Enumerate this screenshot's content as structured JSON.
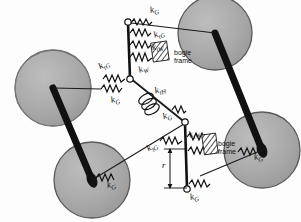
{
  "figure": {
    "type": "mechanical-schematic",
    "bg_color": "#fdfdfd",
    "wheel_fill": "#a8a8a8",
    "wheel_stroke": "#555555",
    "axle_color": "#111111",
    "line_color": "#1a1a1a"
  },
  "wheels": [
    {
      "id": "wheel-upper-left",
      "cx": 53,
      "cy": 88,
      "r": 38
    },
    {
      "id": "wheel-upper-right",
      "cx": 215,
      "cy": 33,
      "r": 37
    },
    {
      "id": "wheel-lower-left",
      "cx": 92,
      "cy": 180,
      "r": 38
    },
    {
      "id": "wheel-lower-right",
      "cx": 262,
      "cy": 150,
      "r": 38
    }
  ],
  "axles": [
    {
      "id": "axle-left",
      "x1": 53,
      "y1": 88,
      "x2": 92,
      "y2": 180
    },
    {
      "id": "axle-right",
      "x1": 215,
      "y1": 33,
      "x2": 262,
      "y2": 150
    }
  ],
  "bars": [
    {
      "id": "bar-upper",
      "x1": 128,
      "y1": 22,
      "x2": 130,
      "y2": 78
    },
    {
      "id": "bar-lower",
      "x1": 185,
      "y1": 122,
      "x2": 187,
      "y2": 189
    }
  ],
  "labels": [
    {
      "id": "label-kg-top",
      "base": "k",
      "sub": "G",
      "x": 150,
      "y": 10,
      "rot": -12
    },
    {
      "id": "label-ktg-top",
      "base": "k",
      "sub": "tG",
      "x": 154,
      "y": 33,
      "rot": -20
    },
    {
      "id": "label-ktw-top",
      "base": "k",
      "sub": "tW",
      "x": 152,
      "y": 47,
      "rot": -12
    },
    {
      "id": "label-kw-top",
      "base": "k",
      "sub": "W",
      "x": 140,
      "y": 70,
      "rot": -22
    },
    {
      "id": "label-ktg-left",
      "base": "k",
      "sub": "tG",
      "x": 101,
      "y": 65,
      "rot": -28
    },
    {
      "id": "label-kg-left",
      "base": "k",
      "sub": "G",
      "x": 113,
      "y": 99,
      "rot": -14
    },
    {
      "id": "label-kth-mid",
      "base": "k",
      "sub": "tH",
      "x": 155,
      "y": 90,
      "rot": -16
    },
    {
      "id": "label-kg-mid",
      "base": "k",
      "sub": "G",
      "x": 163,
      "y": 116,
      "rot": -18
    },
    {
      "id": "label-ktw-bottom",
      "base": "k",
      "sub": "tW",
      "x": 189,
      "y": 135,
      "rot": -18
    },
    {
      "id": "label-ktg-bottom",
      "base": "k",
      "sub": "tG",
      "x": 148,
      "y": 147,
      "rot": -30
    },
    {
      "id": "label-kg-bottom",
      "base": "k",
      "sub": "G",
      "x": 190,
      "y": 196,
      "rot": -12
    },
    {
      "id": "label-kg-wheel-bl",
      "base": "k",
      "sub": "G",
      "x": 108,
      "y": 183,
      "rot": -12
    },
    {
      "id": "label-kg-wheel-br",
      "base": "k",
      "sub": "G",
      "x": 255,
      "y": 155,
      "rot": -12
    },
    {
      "id": "label-r-dimension",
      "base": "r",
      "sub": "",
      "x": 163,
      "y": 165,
      "rot": 0
    }
  ],
  "bogie_frames": [
    {
      "id": "bogie-frame-upper",
      "text_line1": "bogie",
      "text_line2": "frame",
      "x": 174,
      "y": 54
    },
    {
      "id": "bogie-frame-lower",
      "text_line1": "bogie",
      "text_line2": "frame",
      "x": 218,
      "y": 145
    }
  ],
  "springs": {
    "count_upper_cluster": 4,
    "count_lower_cluster": 4,
    "count_wheel_hubs": 2,
    "count_side": 2
  }
}
